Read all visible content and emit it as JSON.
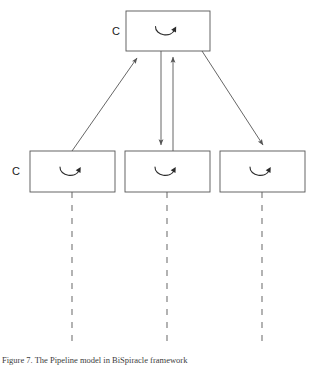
{
  "figure": {
    "kind": "block-diagram",
    "background_color": "#ffffff",
    "stroke_color": "#555555",
    "dashed_color": "#8a8a8a",
    "text_color": "#1a1a1a",
    "width": 323,
    "height": 365,
    "nodes": [
      {
        "id": "top",
        "role": "parent-block",
        "label": "C",
        "label_position": "left-outside",
        "icon": "rotation-arrow-icon",
        "x": 126,
        "y": 11,
        "w": 84,
        "h": 40
      },
      {
        "id": "bottom-left",
        "role": "child-block",
        "label": "C",
        "label_position": "left-outside",
        "icon": "rotation-arrow-icon",
        "x": 30,
        "y": 151,
        "w": 85,
        "h": 41
      },
      {
        "id": "bottom-middle",
        "role": "child-block",
        "label": "",
        "label_position": "none",
        "icon": "rotation-arrow-icon",
        "x": 125,
        "y": 151,
        "w": 85,
        "h": 41
      },
      {
        "id": "bottom-right",
        "role": "child-block",
        "label": "",
        "label_position": "none",
        "icon": "rotation-arrow-icon",
        "x": 220,
        "y": 151,
        "w": 85,
        "h": 41
      }
    ],
    "connectors": [
      {
        "id": "left-up",
        "from": "bottom-left",
        "to": "top",
        "style": "solid",
        "arrowhead": "end",
        "direction": "upward-right"
      },
      {
        "id": "middle-down",
        "from": "top",
        "to": "bottom-middle",
        "style": "solid",
        "arrowhead": "end",
        "direction": "downward"
      },
      {
        "id": "middle-up",
        "from": "bottom-middle",
        "to": "top",
        "style": "solid",
        "arrowhead": "end",
        "direction": "upward"
      },
      {
        "id": "right-down",
        "from": "top",
        "to": "bottom-right",
        "style": "solid",
        "arrowhead": "end",
        "direction": "downward-right"
      }
    ],
    "lifelines": [
      {
        "id": "lifeline-left",
        "x": 72,
        "y_start": 192,
        "y_end": 345,
        "style": "dashed"
      },
      {
        "id": "lifeline-middle",
        "x": 167,
        "y_start": 192,
        "y_end": 345,
        "style": "dashed"
      },
      {
        "id": "lifeline-right",
        "x": 262,
        "y_start": 192,
        "y_end": 345,
        "style": "dashed"
      }
    ]
  },
  "caption": {
    "text": "Figure 7. The Pipeline model in BiSpiracle framework"
  }
}
